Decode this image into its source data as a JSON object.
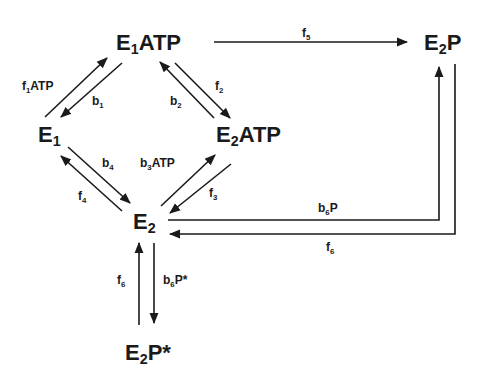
{
  "diagram": {
    "type": "reaction-scheme",
    "nodes": {
      "e1atp": {
        "base": "E",
        "sub": "1",
        "rest": "ATP"
      },
      "e2p": {
        "base": "E",
        "sub": "2",
        "rest": "P"
      },
      "e1": {
        "base": "E",
        "sub": "1",
        "rest": ""
      },
      "e2atp": {
        "base": "E",
        "sub": "2",
        "rest": "ATP"
      },
      "e2": {
        "base": "E",
        "sub": "2",
        "rest": ""
      },
      "e2pstar": {
        "base": "E",
        "sub": "2",
        "rest": "P*"
      }
    },
    "labels": {
      "f1atp": {
        "base": "f",
        "sub": "1",
        "rest": "ATP"
      },
      "b1": {
        "base": "b",
        "sub": "1",
        "rest": ""
      },
      "b2": {
        "base": "b",
        "sub": "2",
        "rest": ""
      },
      "f2": {
        "base": "f",
        "sub": "2",
        "rest": ""
      },
      "f5": {
        "base": "f",
        "sub": "5",
        "rest": ""
      },
      "b4": {
        "base": "b",
        "sub": "4",
        "rest": ""
      },
      "b3atp": {
        "base": "b",
        "sub": "3",
        "rest": "ATP"
      },
      "f4": {
        "base": "f",
        "sub": "4",
        "rest": ""
      },
      "f3": {
        "base": "f",
        "sub": "3",
        "rest": ""
      },
      "b6p": {
        "base": "b",
        "sub": "6",
        "rest": "P"
      },
      "f6_right": {
        "base": "f",
        "sub": "6",
        "rest": ""
      },
      "f6_bottom": {
        "base": "f",
        "sub": "6",
        "rest": ""
      },
      "b6pstar": {
        "base": "b",
        "sub": "6",
        "rest": "P*"
      }
    },
    "edges": [
      {
        "from": "E1",
        "to": "E1ATP",
        "label": "f1ATP"
      },
      {
        "from": "E1ATP",
        "to": "E1",
        "label": "b1"
      },
      {
        "from": "E1ATP",
        "to": "E2ATP",
        "label": "f2"
      },
      {
        "from": "E2ATP",
        "to": "E1ATP",
        "label": "b2"
      },
      {
        "from": "E1ATP",
        "to": "E2P",
        "label": "f5"
      },
      {
        "from": "E1",
        "to": "E2",
        "label": "b4"
      },
      {
        "from": "E2",
        "to": "E1",
        "label": "f4"
      },
      {
        "from": "E2",
        "to": "E2ATP",
        "label": "b3ATP"
      },
      {
        "from": "E2ATP",
        "to": "E2",
        "label": "f3"
      },
      {
        "from": "E2",
        "to": "E2P",
        "label": "b6P"
      },
      {
        "from": "E2P",
        "to": "E2",
        "label": "f6"
      },
      {
        "from": "E2",
        "to": "E2P*",
        "label": "b6P*"
      },
      {
        "from": "E2P*",
        "to": "E2",
        "label": "f6"
      }
    ]
  }
}
